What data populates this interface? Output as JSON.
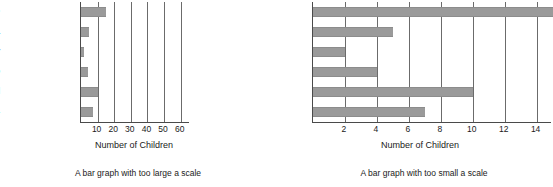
{
  "figure": {
    "background": "#ffffff",
    "bar_color": "#9a9a9a",
    "axis_color": "#4a4a4a",
    "grid_color": "#6b6b6b"
  },
  "charts": [
    {
      "id": "left-chart",
      "caption": "A bar graph with too large a scale",
      "xlabel": "Number of Children",
      "categories": [
        "Chocolate",
        "Vanilla",
        "Strawberry",
        "Chocolate Chip",
        "Rocky Road",
        "Others"
      ],
      "values": [
        15,
        5,
        2,
        4,
        10,
        7
      ],
      "xticks": [
        10,
        20,
        30,
        40,
        50,
        60
      ],
      "xlim": [
        0,
        65
      ],
      "grid": true
    },
    {
      "id": "right-chart",
      "caption": "A bar graph with too small a scale",
      "xlabel": "Number of Children",
      "categories": [
        "Chocolate",
        "Vanilla",
        "Strawberry",
        "Chocolate Chip",
        "Rocky Road",
        "Others"
      ],
      "values": [
        15,
        5,
        2,
        4,
        10,
        7
      ],
      "xticks": [
        2,
        4,
        6,
        8,
        10,
        12,
        14
      ],
      "xlim": [
        0,
        14.9
      ],
      "grid": true
    }
  ],
  "chart_data": [
    {
      "type": "bar",
      "orientation": "horizontal",
      "title": "A bar graph with too large a scale",
      "categories": [
        "Chocolate",
        "Vanilla",
        "Strawberry",
        "Chocolate Chip",
        "Rocky Road",
        "Others"
      ],
      "values": [
        15,
        5,
        2,
        4,
        10,
        7
      ],
      "xlabel": "Number of Children",
      "ylabel": "",
      "xlim": [
        0,
        65
      ],
      "xticks": [
        10,
        20,
        30,
        40,
        50,
        60
      ],
      "grid": true,
      "legend": null
    },
    {
      "type": "bar",
      "orientation": "horizontal",
      "title": "A bar graph with too small a scale",
      "categories": [
        "Chocolate",
        "Vanilla",
        "Strawberry",
        "Chocolate Chip",
        "Rocky Road",
        "Others"
      ],
      "values": [
        15,
        5,
        2,
        4,
        10,
        7
      ],
      "xlabel": "Number of Children",
      "ylabel": "",
      "xlim": [
        0,
        14.9
      ],
      "xticks": [
        2,
        4,
        6,
        8,
        10,
        12,
        14
      ],
      "grid": true,
      "legend": null
    }
  ]
}
